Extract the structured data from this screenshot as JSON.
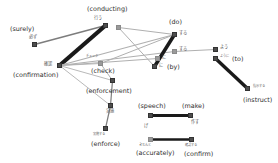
{
  "diagram": {
    "type": "word-alignment-graph",
    "background_color": "#ffffff",
    "node_color": "#4d4d4d",
    "node_color_light": "#9a9a9a",
    "edge_color_dark": "#1a1a1a",
    "edge_color_light": "#b0b0b0",
    "nodes": [
      {
        "id": "surely",
        "jp": "必ず",
        "en": "(surely)",
        "x": 32,
        "y": 42,
        "tone": "dark"
      },
      {
        "id": "conducting",
        "jp": "行う",
        "en": "(conducting)",
        "x": 103,
        "y": 23,
        "tone": "dark"
      },
      {
        "id": "conducting2",
        "jp": "行う",
        "en": "",
        "x": 116,
        "y": 25,
        "tone": "light"
      },
      {
        "id": "confirmation",
        "jp": "確認",
        "en": "(confirmation)",
        "x": 57,
        "y": 63,
        "tone": "dark"
      },
      {
        "id": "check",
        "jp": "チェック",
        "en": "(check)",
        "x": 98,
        "y": 61,
        "tone": "light"
      },
      {
        "id": "do",
        "jp": "する",
        "en": "(do)",
        "x": 172,
        "y": 32,
        "tone": "dark"
      },
      {
        "id": "suru2",
        "jp": "する",
        "en": "",
        "x": 172,
        "y": 49,
        "tone": "light"
      },
      {
        "id": "by1",
        "jp": "に",
        "en": "",
        "x": 155,
        "y": 56,
        "tone": "light"
      },
      {
        "id": "by2",
        "jp": "に",
        "en": "(by)",
        "x": 152,
        "y": 64,
        "tone": "dark"
      },
      {
        "id": "you",
        "jp": "よう",
        "en": "",
        "x": 213,
        "y": 47,
        "tone": "dark"
      },
      {
        "id": "to",
        "jp": "ように",
        "en": "(to)",
        "x": 213,
        "y": 56,
        "tone": "dark"
      },
      {
        "id": "instruct",
        "jp": "指示する",
        "en": "(instruct)",
        "x": 245,
        "y": 86,
        "tone": "dark"
      },
      {
        "id": "enforcement",
        "jp": "実施",
        "en": "(enforcement)",
        "x": 110,
        "y": 78,
        "tone": "dark"
      },
      {
        "id": "enforce_mid",
        "jp": "実施",
        "en": "",
        "x": 108,
        "y": 103,
        "tone": "dark"
      },
      {
        "id": "enforce",
        "jp": "実施する",
        "en": "(enforce)",
        "x": 103,
        "y": 126,
        "tone": "dark"
      },
      {
        "id": "speech",
        "jp": "",
        "en": "(speech)",
        "x": 148,
        "y": 113,
        "tone": "dark"
      },
      {
        "id": "make",
        "jp": "作す",
        "en": "(make)",
        "x": 188,
        "y": 113,
        "tone": "dark"
      },
      {
        "id": "speech_jp",
        "jp": "げ",
        "en": "",
        "x": 148,
        "y": 113,
        "tone": "dark"
      },
      {
        "id": "accurately",
        "jp": "きちんと",
        "en": "(accurately)",
        "x": 148,
        "y": 137,
        "tone": "light"
      },
      {
        "id": "confirm",
        "jp": "確認する",
        "en": "(confirm)",
        "x": 189,
        "y": 137,
        "tone": "dark"
      }
    ],
    "edges": [
      {
        "from": "surely",
        "to": "conducting",
        "weight": 1.6,
        "tone": "mid"
      },
      {
        "from": "confirmation",
        "to": "conducting",
        "weight": 4.2,
        "tone": "dark"
      },
      {
        "from": "confirmation",
        "to": "do",
        "weight": 1.2,
        "tone": "light"
      },
      {
        "from": "confirmation",
        "to": "suru2",
        "weight": 1.0,
        "tone": "light"
      },
      {
        "from": "confirmation",
        "to": "by1",
        "weight": 1.0,
        "tone": "light"
      },
      {
        "from": "confirmation",
        "to": "check",
        "weight": 0.9,
        "tone": "light"
      },
      {
        "from": "confirmation",
        "to": "enforcement",
        "weight": 0.9,
        "tone": "light"
      },
      {
        "from": "confirmation",
        "to": "enforce_mid",
        "weight": 0.9,
        "tone": "light"
      },
      {
        "from": "conducting2",
        "to": "by2",
        "weight": 1.0,
        "tone": "light"
      },
      {
        "from": "conducting2",
        "to": "do",
        "weight": 1.0,
        "tone": "light"
      },
      {
        "from": "check",
        "to": "do",
        "weight": 1.0,
        "tone": "light"
      },
      {
        "from": "check",
        "to": "enforcement",
        "weight": 1.0,
        "tone": "light"
      },
      {
        "from": "do",
        "to": "by2",
        "weight": 3.6,
        "tone": "dark"
      },
      {
        "from": "suru2",
        "to": "you",
        "weight": 1.0,
        "tone": "light"
      },
      {
        "from": "to",
        "to": "instruct",
        "weight": 3.4,
        "tone": "dark"
      },
      {
        "from": "enforcement",
        "to": "enforce_mid",
        "weight": 1.2,
        "tone": "mid"
      },
      {
        "from": "enforce_mid",
        "to": "enforce",
        "weight": 1.2,
        "tone": "mid"
      },
      {
        "from": "speech",
        "to": "make",
        "weight": 3.0,
        "tone": "dark"
      },
      {
        "from": "accurately",
        "to": "confirm",
        "weight": 2.6,
        "tone": "dark"
      }
    ]
  }
}
